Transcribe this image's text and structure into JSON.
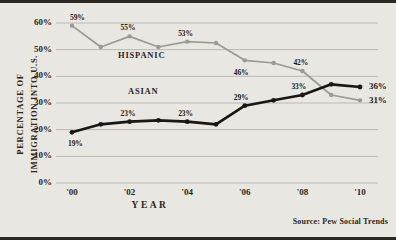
{
  "figure": {
    "background_color": "#e9e7e2",
    "frame_color": "#2b2722",
    "source_note": "Source:  Pew Social Trends"
  },
  "chart_data": {
    "type": "line",
    "title": "",
    "xlabel": "YEAR",
    "ylabel_line1": "PERCENTAGE OF",
    "ylabel_line2": "IMMIGRATION INTO U.S.",
    "x": [
      2000,
      2001,
      2002,
      2003,
      2004,
      2005,
      2006,
      2007,
      2008,
      2009,
      2010
    ],
    "xlim": [
      2000,
      2010
    ],
    "ylim": [
      0,
      60
    ],
    "grid": true,
    "legend_position": "inline-annotations",
    "xtick_labels": [
      "'00",
      "'02",
      "'04",
      "'06",
      "'08",
      "'10"
    ],
    "xtick_values": [
      2000,
      2002,
      2004,
      2006,
      2008,
      2010
    ],
    "ytick_labels": [
      "0%",
      "10%",
      "20%",
      "30%",
      "40%",
      "50%",
      "60%"
    ],
    "ytick_values": [
      0,
      10,
      20,
      30,
      40,
      50,
      60
    ],
    "series": [
      {
        "name": "HISPANIC",
        "color": "#9a9a96",
        "values": [
          59,
          51,
          55,
          51,
          53,
          52.5,
          46,
          45,
          42,
          33,
          31
        ],
        "label_color": "#2a2622"
      },
      {
        "name": "ASIAN",
        "color": "#191613",
        "values": [
          19,
          22,
          23,
          23.5,
          23,
          22,
          29,
          31,
          33,
          37,
          36
        ],
        "label_color": "#1d1a17"
      }
    ],
    "annotations": [
      {
        "text": "59%",
        "series": "HISPANIC",
        "x": 2000,
        "y": 59
      },
      {
        "text": "55%",
        "series": "HISPANIC",
        "x": 2002,
        "y": 55
      },
      {
        "text": "53%",
        "series": "HISPANIC",
        "x": 2004,
        "y": 53
      },
      {
        "text": "46%",
        "series": "HISPANIC",
        "x": 2006,
        "y": 46
      },
      {
        "text": "42%",
        "series": "HISPANIC",
        "x": 2008,
        "y": 42
      },
      {
        "text": "31%",
        "series": "HISPANIC",
        "x": 2010,
        "y": 31
      },
      {
        "text": "19%",
        "series": "ASIAN",
        "x": 2000,
        "y": 19
      },
      {
        "text": "23%",
        "series": "ASIAN",
        "x": 2002,
        "y": 23
      },
      {
        "text": "23%",
        "series": "ASIAN",
        "x": 2004,
        "y": 23
      },
      {
        "text": "29%",
        "series": "ASIAN",
        "x": 2006,
        "y": 29
      },
      {
        "text": "33%",
        "series": "ASIAN",
        "x": 2008,
        "y": 33
      },
      {
        "text": "36%",
        "series": "ASIAN",
        "x": 2010,
        "y": 36
      }
    ],
    "series_labels": [
      {
        "text": "HISPANIC"
      },
      {
        "text": "ASIAN"
      }
    ]
  }
}
